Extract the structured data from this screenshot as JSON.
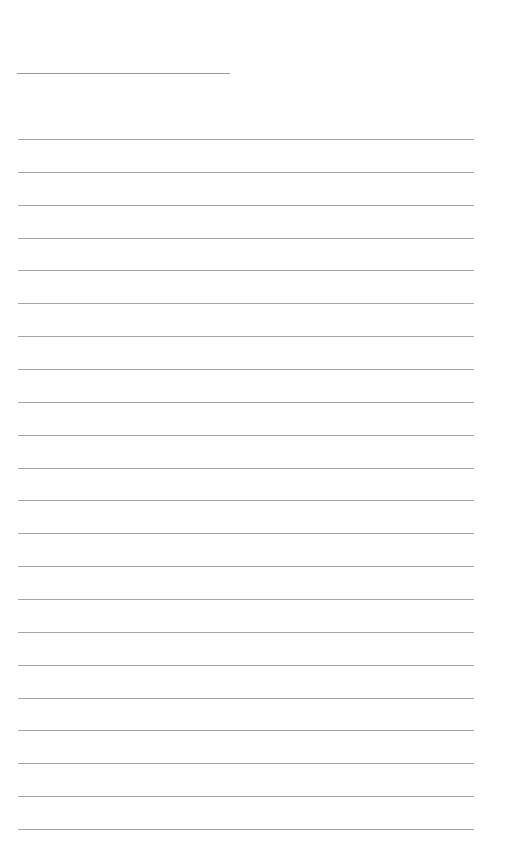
{
  "page": {
    "type": "blank lined paper",
    "background_color": "#ffffff",
    "line_color": "#a4a4a4",
    "title_line": {
      "text": ""
    },
    "ruled_lines": {
      "count": 22,
      "text": ""
    }
  }
}
